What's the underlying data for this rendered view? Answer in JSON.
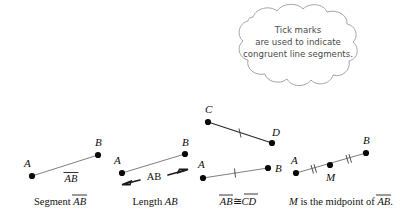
{
  "figure": {
    "background_color": "#ffffff",
    "line_color": "#6f6f6f",
    "dot_color": "#0a0a0a",
    "cloud_stroke_color": "#9a9a9a",
    "cloud_text_color": "#4a4a4a"
  },
  "callout": {
    "name": "tick-marks-cloud",
    "line1": "Tick marks",
    "line2": "are used to indicate",
    "line3": "congruent line segments."
  },
  "panels": [
    {
      "id": "segment-ab",
      "caption_prefix": "Segment ",
      "caption_term": "AB",
      "caption_overline": true,
      "inline_label": "AB",
      "inline_label_overline": true,
      "points": [
        {
          "label": "A",
          "x": 32,
          "y": 176
        },
        {
          "label": "B",
          "x": 98,
          "y": 155
        }
      ],
      "tick_count": 0
    },
    {
      "id": "length-ab",
      "caption_prefix": "Length ",
      "caption_term": "AB",
      "caption_overline": false,
      "inline_label": "AB",
      "inline_label_overline": false,
      "measure_arrow": true,
      "points": [
        {
          "label": "A",
          "x": 122,
          "y": 173
        },
        {
          "label": "B",
          "x": 185,
          "y": 154
        }
      ],
      "tick_count": 0
    },
    {
      "id": "congruent-segments",
      "caption_term_left": "AB",
      "caption_symbol": "≅",
      "caption_term_right": "CD",
      "caption_overline": true,
      "segments": [
        {
          "name": "segment-cd",
          "points": [
            {
              "label": "C",
              "x": 208,
              "y": 122
            },
            {
              "label": "D",
              "x": 272,
              "y": 143
            }
          ],
          "tick_count": 1
        },
        {
          "name": "segment-ab",
          "points": [
            {
              "label": "A",
              "x": 203,
              "y": 178
            },
            {
              "label": "B",
              "x": 268,
              "y": 168
            }
          ],
          "tick_count": 1
        }
      ]
    },
    {
      "id": "midpoint",
      "caption_prefix": "M",
      "caption_middle": " is the midpoint of ",
      "caption_term": "AB",
      "caption_suffix": ".",
      "caption_overline": true,
      "points": [
        {
          "label": "A",
          "x": 296,
          "y": 173
        },
        {
          "label": "M",
          "x": 330,
          "y": 165
        },
        {
          "label": "B",
          "x": 366,
          "y": 153
        }
      ],
      "tick_count": 2
    }
  ]
}
